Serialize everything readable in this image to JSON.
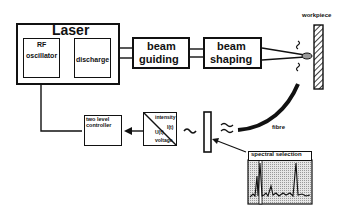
{
  "diagram": {
    "laser": {
      "title": "Laser",
      "rf_oscillator": [
        "RF",
        "oscillator"
      ],
      "discharge": "discharge"
    },
    "beam_guiding": [
      "beam",
      "guiding"
    ],
    "beam_shaping": [
      "beam",
      "shaping"
    ],
    "workpiece": "workpiece",
    "fibre": "fibre",
    "two_level_controller": [
      "two level",
      "controller"
    ],
    "converter": {
      "top": "intensity",
      "mid_right": "I(t)",
      "mid_left": "U(t)",
      "bottom": "voltage"
    },
    "spectral_selection": "spectral selection",
    "colors": {
      "line": "#111111",
      "background": "#ffffff",
      "spectrum_bg": "#cfcfcf"
    }
  }
}
